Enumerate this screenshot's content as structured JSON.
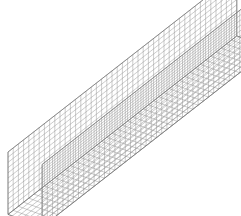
{
  "figure": {
    "title": "",
    "kind": "3d-wireframe-mesh",
    "background_color": "#ffffff",
    "line_color": "#8c8c8c",
    "edge_color": "#6e6e6e",
    "line_width": 0.45,
    "width": 241,
    "height": 216
  },
  "chart_data": {
    "type": "line",
    "title": "",
    "subtitle": "",
    "xlabel": "",
    "ylabel": "",
    "grid": true,
    "legend_position": "none",
    "annotations": [],
    "panels": [
      {
        "name": "left-wall",
        "orientation": "vertical",
        "u_divisions": 44,
        "v_divisions": 12
      },
      {
        "name": "bottom-floor",
        "orientation": "horizontal",
        "u_divisions": 44,
        "v_divisions": 8
      },
      {
        "name": "right-wall",
        "orientation": "vertical",
        "u_divisions": 44,
        "v_divisions": 12
      }
    ],
    "projection": {
      "type": "axonometric",
      "length_axis_screen_dx": 1.0,
      "length_axis_screen_dy": -0.78,
      "width_axis_screen_dx": 0.82,
      "width_axis_screen_dy": 0.3,
      "height_axis_screen_dx": 0.0,
      "height_axis_screen_dy": 1.0
    },
    "geometry": {
      "length_units": 44,
      "channel_width_units": 8,
      "wall_height_units": 12,
      "cell_size_px": 5.2
    },
    "key_vertices": {
      "near_left_wall_top_front": [
        8,
        152
      ],
      "near_left_wall_bottom_front": [
        8,
        208
      ],
      "near_inner_wall_top_front": [
        44,
        136
      ],
      "near_inner_wall_bottom_front": [
        44,
        216
      ],
      "far_left_wall_top_back": [
        196,
        4
      ],
      "far_right_wall_top_back": [
        236,
        16
      ],
      "far_right_wall_bottom_back": [
        216,
        106
      ]
    },
    "axis_ranges": {
      "xlim": [
        0,
        241
      ],
      "ylim": [
        0,
        216
      ]
    }
  }
}
